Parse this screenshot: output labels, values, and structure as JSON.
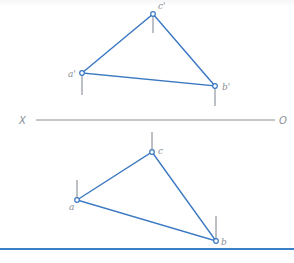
{
  "diagram": {
    "type": "orthographic-projection",
    "colors": {
      "triangle_line": "#3a78c2",
      "projection_tick": "#7b8088",
      "axis_line": "#8a8f96",
      "label": "#8a8f96",
      "footer_rule": "#3a7fc8"
    },
    "axis": {
      "left_label": "X",
      "right_label": "O"
    },
    "front_view": {
      "points": [
        {
          "name": "a'",
          "x": 82,
          "y": 73
        },
        {
          "name": "b'",
          "x": 215,
          "y": 86
        },
        {
          "name": "c'",
          "x": 153,
          "y": 14
        }
      ]
    },
    "top_view": {
      "points": [
        {
          "name": "a",
          "x": 77,
          "y": 200
        },
        {
          "name": "b",
          "x": 216,
          "y": 241
        },
        {
          "name": "c",
          "x": 152,
          "y": 152
        }
      ]
    }
  }
}
